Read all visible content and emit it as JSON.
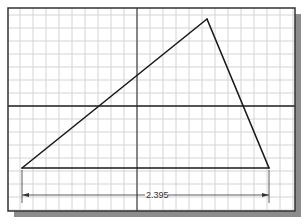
{
  "canvas": {
    "width": 305,
    "height": 224
  },
  "frame": {
    "x": 8,
    "y": 8,
    "width": 287,
    "height": 203,
    "shadow_offset": 6,
    "border_color": "#333333",
    "shadow_color": "#8c8c8c"
  },
  "grid": {
    "spacing": 13,
    "origin_x": 137,
    "origin_y": 106,
    "color": "#d4d4d4"
  },
  "axes": {
    "x_axis_y": 106,
    "y_axis_x": 137,
    "color": "#222222"
  },
  "triangle": {
    "vertices": [
      [
        22,
        168
      ],
      [
        207,
        19
      ],
      [
        269,
        168
      ]
    ],
    "stroke": "#1a1a1a"
  },
  "dimension": {
    "value": "2.395",
    "y": 195,
    "x1": 22,
    "x2": 269,
    "ext_bottom": 203,
    "text_x": 146
  }
}
